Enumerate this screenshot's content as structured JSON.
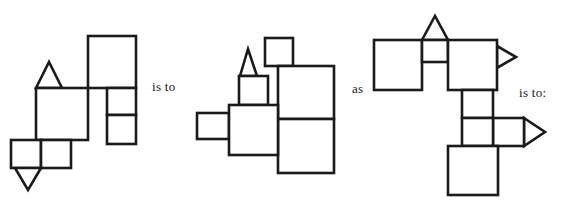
{
  "page": {
    "background_color": "#ffffff",
    "stroke_color": "#1a1a1a",
    "fill_color": "#ffffff",
    "stroke_width": 2.6,
    "width": 564,
    "height": 200
  },
  "connectors": [
    {
      "id": "conn-1",
      "label": "is to",
      "x": 152,
      "y": 79
    },
    {
      "id": "conn-2",
      "label": "as",
      "x": 352,
      "y": 81
    },
    {
      "id": "conn-3",
      "label": "is to:",
      "x": 519,
      "y": 85
    }
  ],
  "figures": [
    {
      "name": "figure-a",
      "role": "analogy-term-1",
      "shapes": [
        {
          "name": "triangle-up-small",
          "type": "triangle",
          "direction": "up",
          "points": "36,88 49,62 62,88"
        },
        {
          "name": "square-large-upper-right",
          "type": "rect",
          "x": 88,
          "y": 36,
          "width": 48,
          "height": 52
        },
        {
          "name": "square-large-center",
          "type": "rect",
          "x": 36,
          "y": 88,
          "width": 52,
          "height": 52
        },
        {
          "name": "square-small-right-top",
          "type": "rect",
          "x": 107,
          "y": 88,
          "width": 29,
          "height": 27
        },
        {
          "name": "square-small-right-bottom",
          "type": "rect",
          "x": 107,
          "y": 115,
          "width": 29,
          "height": 29
        },
        {
          "name": "square-small-lower-left",
          "type": "rect",
          "x": 11,
          "y": 140,
          "width": 30,
          "height": 28
        },
        {
          "name": "square-small-lower-right",
          "type": "rect",
          "x": 41,
          "y": 140,
          "width": 30,
          "height": 28
        },
        {
          "name": "triangle-down-small",
          "type": "triangle",
          "direction": "down",
          "points": "15,168 41,168 28,190"
        }
      ]
    },
    {
      "name": "figure-b",
      "role": "analogy-term-2",
      "shapes": [
        {
          "name": "triangle-up-small",
          "type": "triangle",
          "direction": "up",
          "points": "240,76 248,49 257,76"
        },
        {
          "name": "square-small-top-right",
          "type": "rect",
          "x": 265,
          "y": 38,
          "width": 28,
          "height": 28
        },
        {
          "name": "square-small-under-triangle",
          "type": "rect",
          "x": 239,
          "y": 76,
          "width": 29,
          "height": 29
        },
        {
          "name": "square-large-center",
          "type": "rect",
          "x": 229,
          "y": 105,
          "width": 49,
          "height": 50
        },
        {
          "name": "rect-small-left-tab",
          "type": "rect",
          "x": 197,
          "y": 113,
          "width": 32,
          "height": 26
        },
        {
          "name": "square-large-right-upper",
          "type": "rect",
          "x": 278,
          "y": 66,
          "width": 56,
          "height": 53
        },
        {
          "name": "square-large-right-lower",
          "type": "rect",
          "x": 278,
          "y": 119,
          "width": 56,
          "height": 54
        }
      ]
    },
    {
      "name": "figure-c",
      "role": "analogy-term-3",
      "shapes": [
        {
          "name": "triangle-up-small",
          "type": "triangle",
          "direction": "up",
          "points": "422,40 435,16 448,40"
        },
        {
          "name": "square-large-left",
          "type": "rect",
          "x": 374,
          "y": 40,
          "width": 48,
          "height": 50
        },
        {
          "name": "square-small-under-triangle",
          "type": "rect",
          "x": 422,
          "y": 40,
          "width": 26,
          "height": 22
        },
        {
          "name": "square-large-right",
          "type": "rect",
          "x": 448,
          "y": 40,
          "width": 49,
          "height": 50
        },
        {
          "name": "triangle-right-top",
          "type": "triangle",
          "direction": "right",
          "points": "497,46 516,57 497,68"
        },
        {
          "name": "square-small-mid-upper",
          "type": "rect",
          "x": 462,
          "y": 90,
          "width": 31,
          "height": 28
        },
        {
          "name": "square-small-mid-lower",
          "type": "rect",
          "x": 462,
          "y": 118,
          "width": 31,
          "height": 28
        },
        {
          "name": "square-small-mid-right",
          "type": "rect",
          "x": 493,
          "y": 118,
          "width": 31,
          "height": 28
        },
        {
          "name": "triangle-right-lower",
          "type": "triangle",
          "direction": "right",
          "points": "524,118 545,132 524,146"
        },
        {
          "name": "square-large-bottom",
          "type": "rect",
          "x": 448,
          "y": 146,
          "width": 50,
          "height": 49
        }
      ]
    }
  ]
}
